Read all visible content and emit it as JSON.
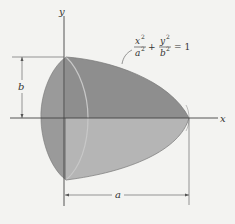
{
  "diagram": {
    "axes": {
      "x_label": "x",
      "y_label": "y"
    },
    "equation": {
      "x_num": "x",
      "x_exp": "2",
      "x_den": "a",
      "x_den_exp": "2",
      "plus": "+",
      "y_num": "y",
      "y_exp": "2",
      "y_den": "b",
      "y_den_exp": "2",
      "equals": "= 1",
      "full": "x²/a² + y²/b² = 1"
    },
    "dimensions": {
      "height_label": "b",
      "length_label": "a"
    },
    "colors": {
      "background": "#f3f3f1",
      "solid_upper": "#8f8f8f",
      "solid_lower": "#b4b4b4",
      "solid_front": "#9c9c9c",
      "lines": "#444444"
    }
  }
}
